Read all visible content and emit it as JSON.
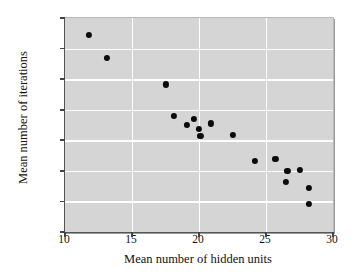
{
  "chart_data": {
    "type": "scatter",
    "title": "",
    "xlabel": "Mean number of hidden units",
    "ylabel": "Mean number of iterations",
    "xlim": [
      10,
      30
    ],
    "ylim": [
      3200,
      4600
    ],
    "xticks": [
      10,
      15,
      20,
      25,
      30
    ],
    "yticks": [
      3200,
      3400,
      3600,
      3800,
      4000,
      4200,
      4400,
      4600
    ],
    "grid": true,
    "legend": "none",
    "marker": {
      "shape": "circle",
      "color": "#0b0b0b",
      "size": 6
    },
    "plot_background": "#d5d5d5",
    "gridline_color": "#ffffff",
    "points": [
      {
        "x": 11.8,
        "y": 4490
      },
      {
        "x": 13.1,
        "y": 4340
      },
      {
        "x": 17.5,
        "y": 4165
      },
      {
        "x": 18.1,
        "y": 3960
      },
      {
        "x": 19.1,
        "y": 3900
      },
      {
        "x": 19.6,
        "y": 3940
      },
      {
        "x": 20.0,
        "y": 3875
      },
      {
        "x": 20.1,
        "y": 3830
      },
      {
        "x": 20.9,
        "y": 3910
      },
      {
        "x": 22.5,
        "y": 3835
      },
      {
        "x": 24.2,
        "y": 3665
      },
      {
        "x": 25.7,
        "y": 3680
      },
      {
        "x": 26.6,
        "y": 3600
      },
      {
        "x": 27.5,
        "y": 3605
      },
      {
        "x": 26.5,
        "y": 3530
      },
      {
        "x": 28.2,
        "y": 3490
      },
      {
        "x": 28.2,
        "y": 3385
      }
    ]
  }
}
